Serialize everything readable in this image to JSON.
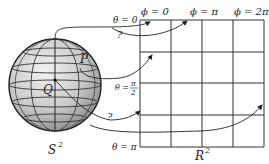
{
  "diagram": {
    "sphere_label": "S",
    "sphere_label_sup": "2",
    "plane_label": "R",
    "plane_label_sup": "2",
    "point_p": "P",
    "point_q": "Q",
    "question_marks": [
      "?",
      "?"
    ],
    "phi_labels": [
      "ϕ = 0",
      "ϕ = π",
      "ϕ = 2π"
    ],
    "theta_labels": {
      "top": "θ = 0",
      "middle_prefix": "θ =",
      "middle_num": "π",
      "middle_den": "2",
      "bottom": "θ = π"
    }
  }
}
